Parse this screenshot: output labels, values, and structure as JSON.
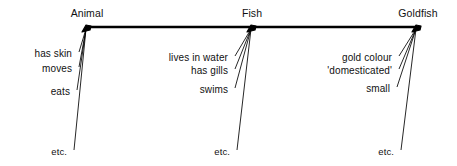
{
  "diagram": {
    "type": "semantic-network-hierarchy",
    "line_color": "#000000",
    "text_color": "#111111",
    "background": "#ffffff",
    "spine": {
      "label": "horizontal-hierarchy-line",
      "x_start": 87,
      "x_end": 417,
      "y": 27
    },
    "nodes": [
      {
        "id": "animal",
        "title": "Animal",
        "node_x": 87,
        "node_y": 27,
        "title_x": 87,
        "title_y": 8,
        "attributes": [
          {
            "text": "has skin",
            "x": 72,
            "y": 48,
            "anchor_x": 79,
            "anchor_y": 52
          },
          {
            "text": "moves",
            "x": 72,
            "y": 63,
            "anchor_x": 79,
            "anchor_y": 67
          },
          {
            "text": "eats",
            "x": 70,
            "y": 86,
            "anchor_x": 77,
            "anchor_y": 90
          },
          {
            "text": "etc.",
            "x": 67,
            "y": 146,
            "anchor_x": 74,
            "anchor_y": 150
          }
        ]
      },
      {
        "id": "fish",
        "title": "Fish",
        "node_x": 252,
        "node_y": 27,
        "title_x": 252,
        "title_y": 8,
        "attributes": [
          {
            "text": "lives in water",
            "x": 228,
            "y": 52,
            "anchor_x": 235,
            "anchor_y": 56
          },
          {
            "text": "has gills",
            "x": 228,
            "y": 65,
            "anchor_x": 235,
            "anchor_y": 69
          },
          {
            "text": "swims",
            "x": 228,
            "y": 84,
            "anchor_x": 235,
            "anchor_y": 88
          },
          {
            "text": "etc.",
            "x": 230,
            "y": 146,
            "anchor_x": 237,
            "anchor_y": 150
          }
        ]
      },
      {
        "id": "goldfish",
        "title": "Goldfish",
        "node_x": 417,
        "node_y": 27,
        "title_x": 418,
        "title_y": 8,
        "attributes": [
          {
            "text": "gold colour",
            "x": 392,
            "y": 52,
            "anchor_x": 399,
            "anchor_y": 56
          },
          {
            "text": "'domesticated'",
            "x": 392,
            "y": 65,
            "anchor_x": 399,
            "anchor_y": 69
          },
          {
            "text": "small",
            "x": 390,
            "y": 83,
            "anchor_x": 397,
            "anchor_y": 87
          },
          {
            "text": "etc.",
            "x": 394,
            "y": 146,
            "anchor_x": 401,
            "anchor_y": 150
          }
        ]
      }
    ]
  }
}
